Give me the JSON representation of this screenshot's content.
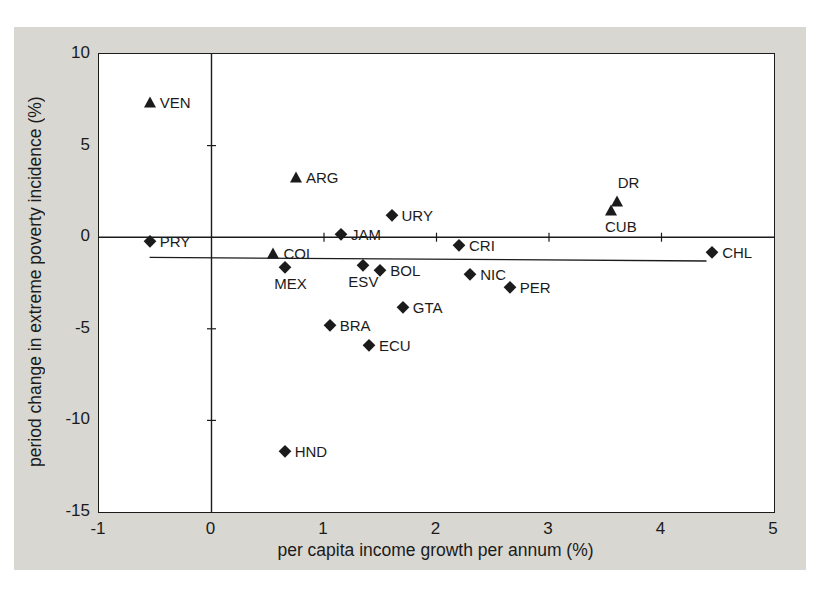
{
  "figure": {
    "panel_color": "#d8d7d2",
    "ink_color": "#1b1b1b",
    "plot_background": "#ffffff"
  },
  "chart_data": {
    "type": "scatter",
    "title": "",
    "xlabel": "per capita income growth per annum (%)",
    "ylabel": "period change in extreme poverty incidence (%)",
    "xlim": [
      -1,
      5
    ],
    "ylim": [
      -15,
      10
    ],
    "x_ticks": [
      -1,
      0,
      1,
      2,
      3,
      4,
      5
    ],
    "y_ticks": [
      10,
      5,
      0,
      -5,
      -10,
      -15
    ],
    "grid": false,
    "legend": "none",
    "zero_lines": {
      "horizontal_at_y": 0,
      "vertical_at_x": 0
    },
    "inner_ticks": {
      "on_horizontal_zero_line_x": [
        1,
        2,
        3,
        4
      ],
      "on_vertical_zero_line_y": [
        5,
        -5,
        -10
      ]
    },
    "trend_line": {
      "x1": -0.55,
      "y1": -1.1,
      "x2": 4.4,
      "y2": -1.3
    },
    "marker_meaning": {
      "triangle": "poverty increase",
      "diamond": "poverty decrease"
    },
    "points": [
      {
        "code": "VEN",
        "x": -0.55,
        "y": 7.4,
        "marker": "triangle",
        "label_pos": "right"
      },
      {
        "code": "ARG",
        "x": 0.75,
        "y": 3.3,
        "marker": "triangle",
        "label_pos": "right"
      },
      {
        "code": "PRY",
        "x": -0.55,
        "y": -0.2,
        "marker": "diamond",
        "label_pos": "right"
      },
      {
        "code": "JAM",
        "x": 1.15,
        "y": 0.15,
        "marker": "diamond",
        "label_pos": "right"
      },
      {
        "code": "URY",
        "x": 1.6,
        "y": 1.2,
        "marker": "diamond",
        "label_pos": "right"
      },
      {
        "code": "COL",
        "x": 0.55,
        "y": -0.85,
        "marker": "triangle",
        "label_pos": "right"
      },
      {
        "code": "MEX",
        "x": 0.65,
        "y": -1.6,
        "marker": "diamond",
        "label_pos": "below",
        "dx": 6
      },
      {
        "code": "ESV",
        "x": 1.35,
        "y": -1.5,
        "marker": "diamond",
        "label_pos": "below"
      },
      {
        "code": "BOL",
        "x": 1.5,
        "y": -1.8,
        "marker": "diamond",
        "label_pos": "right"
      },
      {
        "code": "CRI",
        "x": 2.2,
        "y": -0.4,
        "marker": "diamond",
        "label_pos": "right"
      },
      {
        "code": "NIC",
        "x": 2.3,
        "y": -2.0,
        "marker": "diamond",
        "label_pos": "right"
      },
      {
        "code": "PER",
        "x": 2.65,
        "y": -2.7,
        "marker": "diamond",
        "label_pos": "right"
      },
      {
        "code": "GTA",
        "x": 1.7,
        "y": -3.8,
        "marker": "diamond",
        "label_pos": "right"
      },
      {
        "code": "BRA",
        "x": 1.05,
        "y": -4.8,
        "marker": "diamond",
        "label_pos": "right"
      },
      {
        "code": "ECU",
        "x": 1.4,
        "y": -5.9,
        "marker": "diamond",
        "label_pos": "right"
      },
      {
        "code": "HND",
        "x": 0.65,
        "y": -11.65,
        "marker": "diamond",
        "label_pos": "right"
      },
      {
        "code": "DR",
        "x": 3.6,
        "y": 2.0,
        "marker": "triangle",
        "label_pos": "above",
        "dx": 12
      },
      {
        "code": "CUB",
        "x": 3.55,
        "y": 1.5,
        "marker": "triangle",
        "label_pos": "below",
        "dx": 10
      },
      {
        "code": "CHL",
        "x": 4.45,
        "y": -0.8,
        "marker": "diamond",
        "label_pos": "right"
      }
    ]
  }
}
